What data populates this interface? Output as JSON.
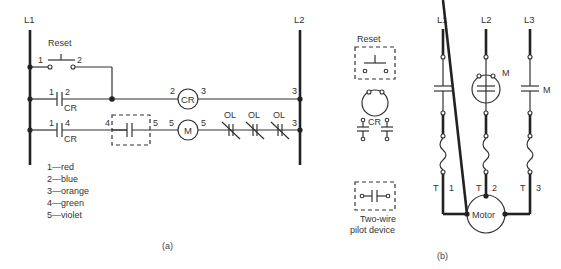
{
  "figure_a": {
    "caption": "(a)",
    "rail_left": "L1",
    "rail_right": "L2",
    "rung1": {
      "device": "Reset",
      "left_wire": "1",
      "right_wire": "2"
    },
    "rung2": {
      "contact_left": "1",
      "contact_right": "2",
      "contact_tag": "CR",
      "coil": "CR",
      "coil_left": "2",
      "coil_right": "3",
      "end_wire": "3"
    },
    "rung3": {
      "contact_left": "1",
      "contact_right": "4",
      "contact_tag": "CR",
      "pilot_left": "4",
      "pilot_right": "5",
      "coil": "M",
      "coil_left": "5",
      "coil_right": "5",
      "overloads": [
        "OL",
        "OL",
        "OL"
      ],
      "end_wire": "3"
    },
    "color_code": [
      "1—red",
      "2—blue",
      "3—orange",
      "4—green",
      "5—violet"
    ]
  },
  "legend_symbols": {
    "reset_label": "Reset",
    "cr_label": "CR",
    "pilot_label_line1": "Two-wire",
    "pilot_label_line2": "pilot device"
  },
  "figure_b": {
    "caption": "(b)",
    "lines": [
      "L1",
      "L2",
      "L3"
    ],
    "contactor_label_m1": "M",
    "contactor_label_m2": "M",
    "terminals": [
      {
        "t": "T",
        "n": "1"
      },
      {
        "t": "T",
        "n": "2"
      },
      {
        "t": "T",
        "n": "3"
      }
    ],
    "motor_label": "Motor"
  }
}
